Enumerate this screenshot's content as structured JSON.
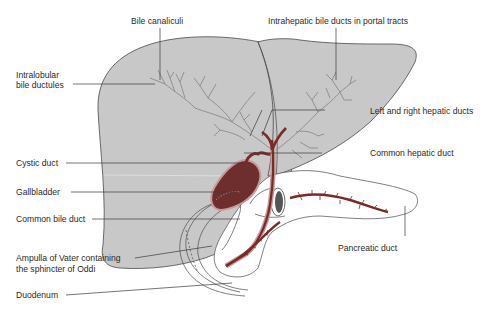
{
  "diagram": {
    "colors": {
      "liver_fill": "#c8c8c8",
      "liver_outline": "#4a4a4a",
      "duct_red": "#7a2a2a",
      "duct_pink": "#c89a9a",
      "gallbladder_fill": "#6e2e2e",
      "intrahepatic_duct": "#8a8a8a",
      "leader_line": "#3a3a3a",
      "label_text": "#2a2a2a"
    },
    "labels": {
      "bile_canaliculi": "Bile canaliculi",
      "intrahepatic_ducts": "Intrahepatic bile ducts in portal tracts",
      "intralobular_line1": "Intralobular",
      "intralobular_line2": "bile ductules",
      "left_right_hepatic": "Left and right hepatic ducts",
      "cystic_duct": "Cystic duct",
      "common_hepatic": "Common hepatic duct",
      "gallbladder": "Gallbladder",
      "common_bile_duct": "Common bile duct",
      "pancreatic_duct": "Pancreatic duct",
      "ampulla_line1": "Ampulla of Vater containing",
      "ampulla_line2": "the sphincter of Oddi",
      "duodenum": "Duodenum"
    }
  }
}
